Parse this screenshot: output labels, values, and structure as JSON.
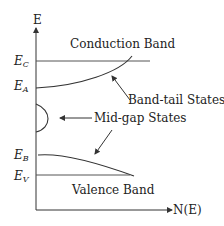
{
  "diagram": {
    "axes": {
      "y_label": "E",
      "x_label": "N(E)"
    },
    "levels": [
      {
        "symbol": "E",
        "subscript": "C"
      },
      {
        "symbol": "E",
        "subscript": "A"
      },
      {
        "symbol": "E",
        "subscript": "B"
      },
      {
        "symbol": "E",
        "subscript": "V"
      }
    ],
    "labels": {
      "conduction_band": "Conduction Band",
      "valence_band": "Valence Band",
      "band_tail_states": "Band-tail States",
      "mid_gap_states": "Mid-gap States"
    },
    "colors": {
      "line": "#333333",
      "background": "#ffffff"
    }
  }
}
